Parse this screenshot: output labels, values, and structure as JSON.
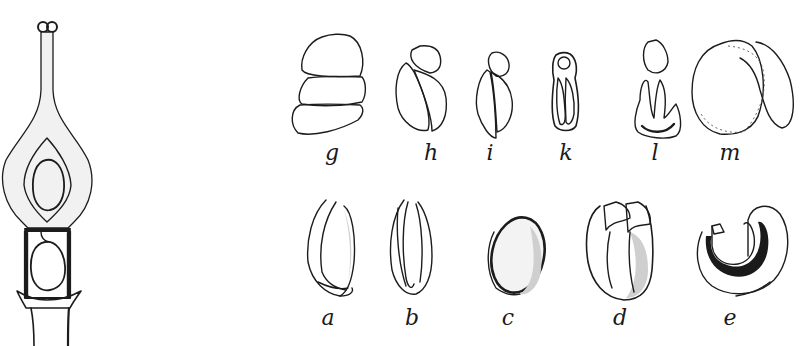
{
  "figure": {
    "left_figure": {
      "description": "Pistil with ovary, style and bilobed stigma; ovule shown in upper and lower chambers"
    },
    "top_row": {
      "panels": [
        {
          "label": "g",
          "x": 332
        },
        {
          "label": "h",
          "x": 431
        },
        {
          "label": "i",
          "x": 490
        },
        {
          "label": "k",
          "x": 566
        },
        {
          "label": "l",
          "x": 655
        },
        {
          "label": "m",
          "x": 730
        }
      ]
    },
    "bottom_row": {
      "panels": [
        {
          "label": "a",
          "x": 328
        },
        {
          "label": "b",
          "x": 412
        },
        {
          "label": "c",
          "x": 508
        },
        {
          "label": "d",
          "x": 620
        },
        {
          "label": "e",
          "x": 730
        }
      ]
    },
    "colors": {
      "ink": "#1c1c1c",
      "paper": "#ffffff",
      "stipple": "#f1f1f1"
    }
  }
}
